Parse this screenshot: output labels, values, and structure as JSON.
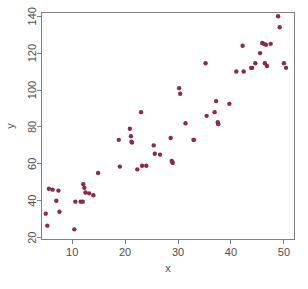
{
  "chart_data": {
    "type": "scatter",
    "title": "",
    "xlabel": "x",
    "ylabel": "y",
    "xlim": [
      4.2,
      52.0
    ],
    "ylim": [
      19.0,
      142.0
    ],
    "grid": false,
    "legend": null,
    "point_color": "#8B2950",
    "point_size": 2.2,
    "background": "#ffffff",
    "frame_color": "#808080",
    "xticks": [
      10,
      20,
      30,
      40,
      50
    ],
    "yticks": [
      20,
      40,
      60,
      80,
      100,
      120,
      140
    ],
    "xtick_labels": [
      "10",
      "20",
      "30",
      "40",
      "50"
    ],
    "ytick_labels": [
      "20",
      "40",
      "60",
      "80",
      "100",
      "120",
      "140"
    ],
    "n_points": 63,
    "x": [
      5.0,
      5.3,
      5.6,
      6.3,
      7.0,
      7.4,
      7.6,
      10.4,
      10.6,
      11.6,
      12.1,
      12.3,
      12.5,
      13.2,
      14.0,
      14.9,
      18.8,
      19.0,
      20.9,
      21.1,
      21.2,
      21.3,
      22.3,
      23.0,
      23.2,
      25.4,
      25.6,
      26.6,
      28.6,
      28.8,
      28.9,
      29.0,
      30.2,
      30.4,
      31.4,
      32.9,
      35.2,
      35.4,
      36.9,
      37.2,
      37.5,
      37.6,
      39.7,
      42.2,
      42.4,
      43.8,
      44.6,
      45.5,
      45.9,
      46.2,
      46.4,
      46.6,
      46.8,
      48.9,
      49.2,
      50.0,
      50.4,
      12.0,
      24.0,
      33.0,
      41.0,
      44.0,
      47.5
    ],
    "y": [
      33.0,
      26.5,
      46.5,
      46.0,
      40.0,
      45.5,
      34.0,
      24.5,
      39.5,
      39.5,
      49.0,
      47.0,
      44.5,
      44.0,
      43.0,
      55.0,
      73.0,
      58.5,
      79.0,
      75.0,
      72.0,
      71.5,
      57.0,
      88.0,
      59.0,
      70.0,
      65.5,
      65.0,
      74.0,
      61.5,
      61.0,
      60.5,
      101.0,
      98.0,
      82.0,
      73.0,
      114.5,
      86.0,
      88.0,
      94.0,
      82.5,
      81.5,
      92.5,
      124.0,
      110.0,
      112.0,
      114.5,
      120.0,
      125.5,
      125.0,
      114.5,
      124.5,
      113.0,
      140.0,
      134.0,
      114.5,
      112.0,
      39.5,
      59.0,
      73.0,
      110.0,
      112.0,
      125.0
    ]
  },
  "axes": {
    "x_title": "x",
    "y_title": "y"
  }
}
